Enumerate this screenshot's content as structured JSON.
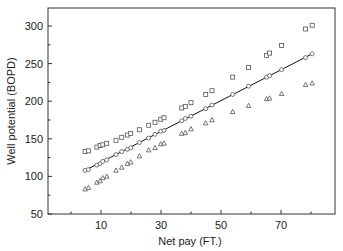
{
  "chart_data": {
    "type": "scatter",
    "title": "",
    "xlabel": "Net pay (FT.)",
    "ylabel": "Well potential (BOPD)",
    "xlim": [
      -7.7,
      88
    ],
    "ylim": [
      50,
      324
    ],
    "x_ticks": [
      10,
      30,
      50,
      70
    ],
    "x_minor_ticks": [
      0,
      20,
      40,
      60,
      80
    ],
    "y_ticks": [
      50,
      100,
      150,
      200,
      250,
      300
    ],
    "y_minor_ticks": [
      75,
      125,
      175,
      225,
      275
    ],
    "grid": false,
    "legend": null,
    "x": [
      4.7,
      5.8,
      8.6,
      9.7,
      10.6,
      11.9,
      15.0,
      16.9,
      18.8,
      19.9,
      22.8,
      25.9,
      28.0,
      29.9,
      31.0,
      36.9,
      38.1,
      40.0,
      44.9,
      47.0,
      53.9,
      59.2,
      65.2,
      66.2,
      70.2,
      78.2,
      80.4
    ],
    "series": [
      {
        "name": "Upper bound",
        "marker": "square",
        "values": [
          133,
          134,
          139,
          141,
          142,
          144,
          148,
          152,
          155,
          157,
          162,
          168,
          172,
          176,
          178,
          191,
          193,
          198,
          209,
          214,
          232,
          245,
          261,
          264,
          274,
          296,
          301
        ]
      },
      {
        "name": "Well potential",
        "marker": "circle",
        "line": true,
        "values": [
          108,
          109,
          115,
          117,
          120,
          122,
          129,
          133,
          136,
          138,
          145,
          151,
          156,
          160,
          161,
          174,
          177,
          180,
          190,
          195,
          209,
          220,
          232,
          234,
          242,
          258,
          263
        ]
      },
      {
        "name": "Lower bound",
        "marker": "triangle",
        "values": [
          83,
          85,
          92,
          94,
          98,
          100,
          108,
          112,
          117,
          119,
          127,
          135,
          138,
          143,
          144,
          157,
          158,
          163,
          171,
          175,
          186,
          194,
          203,
          204,
          210,
          222,
          224
        ]
      }
    ]
  },
  "colors": {
    "axis": "#333333",
    "marker": "#555555",
    "line": "#111111"
  }
}
